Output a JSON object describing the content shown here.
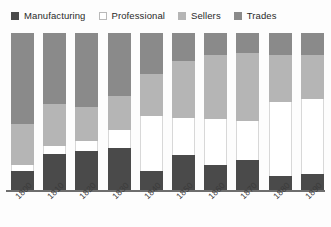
{
  "legend": {
    "position": "top",
    "items": [
      {
        "label": "Manufacturing",
        "color": "#4a4a4a",
        "bordered": false
      },
      {
        "label": "Professional",
        "color": "#ffffff",
        "bordered": true
      },
      {
        "label": "Sellers",
        "color": "#b5b5b5",
        "bordered": false
      },
      {
        "label": "Trades",
        "color": "#8a8a8a",
        "bordered": false
      }
    ]
  },
  "chart_data": {
    "type": "bar",
    "stacked": true,
    "normalized": true,
    "title": "",
    "subtitle": "",
    "xlabel": "",
    "ylabel": "",
    "ylim": [
      0,
      100
    ],
    "grid": false,
    "legend_position": "top",
    "categories": [
      "1800",
      "1810",
      "1820",
      "1830",
      "1840",
      "1850",
      "1860",
      "1870",
      "1880",
      "1890"
    ],
    "series": [
      {
        "name": "Trades",
        "color": "#8a8a8a",
        "values": [
          58,
          45,
          47,
          40,
          26,
          18,
          14,
          13,
          14,
          14
        ]
      },
      {
        "name": "Sellers",
        "color": "#b5b5b5",
        "values": [
          26,
          27,
          22,
          22,
          27,
          36,
          41,
          43,
          30,
          28
        ]
      },
      {
        "name": "Professional",
        "color": "#ffffff",
        "values": [
          4,
          5,
          6,
          11,
          35,
          24,
          29,
          25,
          47,
          48
        ]
      },
      {
        "name": "Manufacturing",
        "color": "#4a4a4a",
        "values": [
          12,
          23,
          25,
          27,
          12,
          22,
          16,
          19,
          9,
          10
        ]
      }
    ],
    "stack_order_top_to_bottom": [
      "Trades",
      "Sellers",
      "Professional",
      "Manufacturing"
    ],
    "axis_color": "#6e6e6e",
    "background": "#fdfdfd"
  }
}
